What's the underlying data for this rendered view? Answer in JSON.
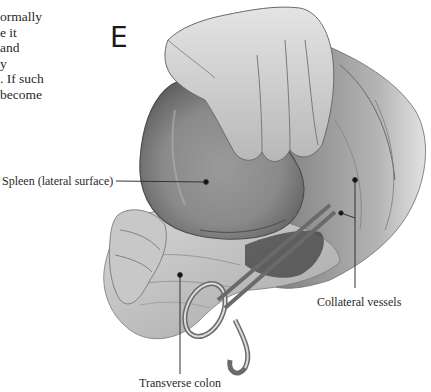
{
  "body_text": {
    "lines": [
      "ormally",
      "e it",
      "and",
      "y",
      ". If such",
      "become"
    ]
  },
  "figure": {
    "panel_letter": "E",
    "labels": {
      "spleen": "Spleen (lateral surface)",
      "collateral": "Collateral vessels",
      "colon": "Transverse colon"
    }
  }
}
